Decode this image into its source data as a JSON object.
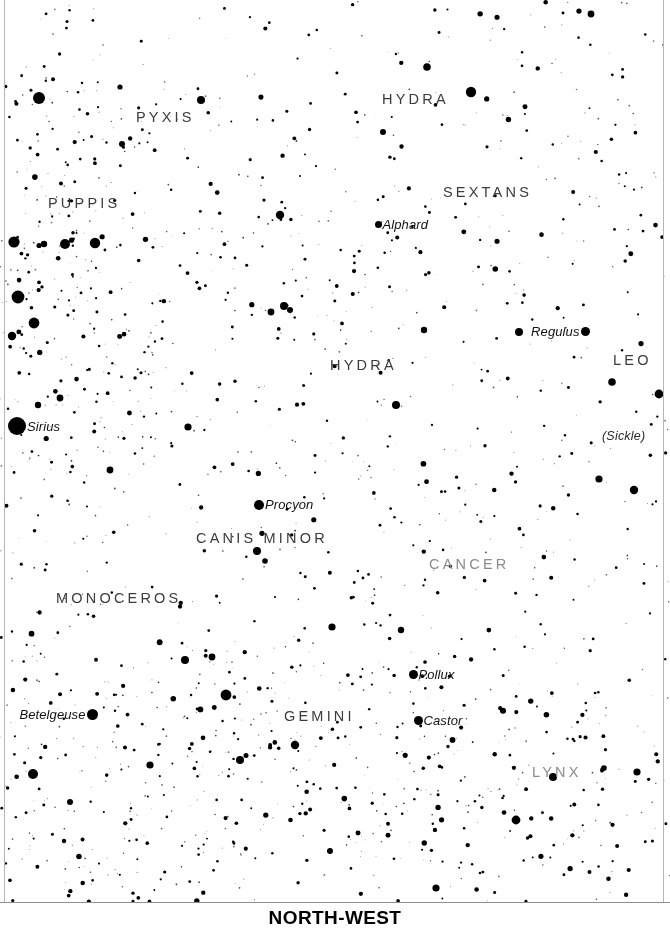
{
  "chart": {
    "type": "sky-chart",
    "title": "",
    "direction_caption": "NORTH-WEST",
    "width": 670,
    "height": 932,
    "sky_height": 903,
    "background_color": "#ffffff",
    "star_color": "#000000",
    "frame_color": "#b6b6b6",
    "label_color": "#3b3b3b",
    "faint_label_color": "#8b8b8b"
  },
  "constellation_labels": [
    {
      "name": "PYXIS",
      "x": 136,
      "y": 110,
      "faint": false
    },
    {
      "name": "HYDRA",
      "x": 382,
      "y": 92,
      "faint": false
    },
    {
      "name": "PUPPIS",
      "x": 48,
      "y": 196,
      "faint": false
    },
    {
      "name": "SEXTANS",
      "x": 443,
      "y": 185,
      "faint": false
    },
    {
      "name": "HYDRA",
      "x": 330,
      "y": 358,
      "faint": false
    },
    {
      "name": "LEO",
      "x": 613,
      "y": 353,
      "faint": false
    },
    {
      "name": "CANIS MINOR",
      "x": 196,
      "y": 531,
      "faint": false
    },
    {
      "name": "CANCER",
      "x": 429,
      "y": 557,
      "faint": true
    },
    {
      "name": "MONOCEROS",
      "x": 56,
      "y": 591,
      "faint": false
    },
    {
      "name": "GEMINI",
      "x": 284,
      "y": 709,
      "faint": false
    },
    {
      "name": "LYNX",
      "x": 532,
      "y": 765,
      "faint": true
    }
  ],
  "aux_labels": [
    {
      "name": "(Sickle)",
      "x": 602,
      "y": 430
    }
  ],
  "named_stars": [
    {
      "name": "Alphard",
      "x": 378,
      "y": 226,
      "size": 7,
      "name_side": "right"
    },
    {
      "name": "Regulus",
      "x": 585,
      "y": 333,
      "size": 9,
      "name_side": "left"
    },
    {
      "name": "Sirius",
      "x": 17,
      "y": 425,
      "size": 18,
      "name_side": "right"
    },
    {
      "name": "Procyon",
      "x": 259,
      "y": 506,
      "size": 10,
      "name_side": "right"
    },
    {
      "name": "Pollux",
      "x": 413,
      "y": 676,
      "size": 9,
      "name_side": "right"
    },
    {
      "name": "Castor",
      "x": 418,
      "y": 722,
      "size": 9,
      "name_side": "right"
    },
    {
      "name": "Betelgeuse",
      "x": 92,
      "y": 716,
      "size": 11,
      "name_side": "left"
    }
  ],
  "bright_stars": [
    {
      "x": 39,
      "y": 98,
      "r": 6.0
    },
    {
      "x": 201,
      "y": 100,
      "r": 4.0
    },
    {
      "x": 427,
      "y": 67,
      "r": 3.8
    },
    {
      "x": 471,
      "y": 92,
      "r": 5.2
    },
    {
      "x": 591,
      "y": 14,
      "r": 3.4
    },
    {
      "x": 14,
      "y": 242,
      "r": 5.6
    },
    {
      "x": 44,
      "y": 244,
      "r": 3.2
    },
    {
      "x": 65,
      "y": 244,
      "r": 5.0
    },
    {
      "x": 95,
      "y": 243,
      "r": 5.2
    },
    {
      "x": 18,
      "y": 297,
      "r": 6.4
    },
    {
      "x": 34,
      "y": 323,
      "r": 5.4
    },
    {
      "x": 12,
      "y": 336,
      "r": 4.2
    },
    {
      "x": 120,
      "y": 87,
      "r": 2.6
    },
    {
      "x": 383,
      "y": 132,
      "r": 3.0
    },
    {
      "x": 284,
      "y": 306,
      "r": 4.0
    },
    {
      "x": 290,
      "y": 310,
      "r": 3.0
    },
    {
      "x": 122,
      "y": 144,
      "r": 3.0
    },
    {
      "x": 280,
      "y": 215,
      "r": 4.2
    },
    {
      "x": 271,
      "y": 312,
      "r": 3.4
    },
    {
      "x": 396,
      "y": 405,
      "r": 4.0
    },
    {
      "x": 424,
      "y": 330,
      "r": 3.2
    },
    {
      "x": 519,
      "y": 332,
      "r": 4.0
    },
    {
      "x": 612,
      "y": 382,
      "r": 3.8
    },
    {
      "x": 659,
      "y": 394,
      "r": 4.4
    },
    {
      "x": 599,
      "y": 479,
      "r": 3.6
    },
    {
      "x": 634,
      "y": 490,
      "r": 4.2
    },
    {
      "x": 257,
      "y": 551,
      "r": 4.0
    },
    {
      "x": 265,
      "y": 561,
      "r": 2.8
    },
    {
      "x": 110,
      "y": 470,
      "r": 3.4
    },
    {
      "x": 188,
      "y": 427,
      "r": 3.6
    },
    {
      "x": 38,
      "y": 405,
      "r": 3.2
    },
    {
      "x": 60,
      "y": 398,
      "r": 3.4
    },
    {
      "x": 226,
      "y": 695,
      "r": 5.4
    },
    {
      "x": 185,
      "y": 660,
      "r": 4.0
    },
    {
      "x": 295,
      "y": 745,
      "r": 4.2
    },
    {
      "x": 150,
      "y": 765,
      "r": 3.6
    },
    {
      "x": 33,
      "y": 774,
      "r": 5.0
    },
    {
      "x": 240,
      "y": 760,
      "r": 4.0
    },
    {
      "x": 332,
      "y": 627,
      "r": 3.6
    },
    {
      "x": 401,
      "y": 630,
      "r": 3.2
    },
    {
      "x": 516,
      "y": 820,
      "r": 4.4
    },
    {
      "x": 553,
      "y": 777,
      "r": 4.0
    },
    {
      "x": 637,
      "y": 772,
      "r": 3.6
    },
    {
      "x": 212,
      "y": 657,
      "r": 3.4
    },
    {
      "x": 436,
      "y": 888,
      "r": 3.6
    },
    {
      "x": 70,
      "y": 802,
      "r": 3.0
    },
    {
      "x": 330,
      "y": 851,
      "r": 3.0
    }
  ],
  "density_zones": [
    {
      "cx": 60,
      "cy": 300,
      "rx": 150,
      "ry": 260,
      "weight": 2.4
    },
    {
      "cx": 120,
      "cy": 760,
      "rx": 180,
      "ry": 200,
      "weight": 1.6
    },
    {
      "cx": 330,
      "cy": 760,
      "rx": 220,
      "ry": 180,
      "weight": 1.5
    },
    {
      "cx": 560,
      "cy": 820,
      "rx": 160,
      "ry": 140,
      "weight": 1.3
    },
    {
      "cx": 430,
      "cy": 540,
      "rx": 130,
      "ry": 110,
      "weight": 0.55
    },
    {
      "cx": 340,
      "cy": 300,
      "rx": 180,
      "ry": 150,
      "weight": 0.8
    }
  ],
  "generation": {
    "seed": 20240917,
    "base_star_count": 1700,
    "min_radius": 0.45,
    "max_radius": 3.1
  }
}
